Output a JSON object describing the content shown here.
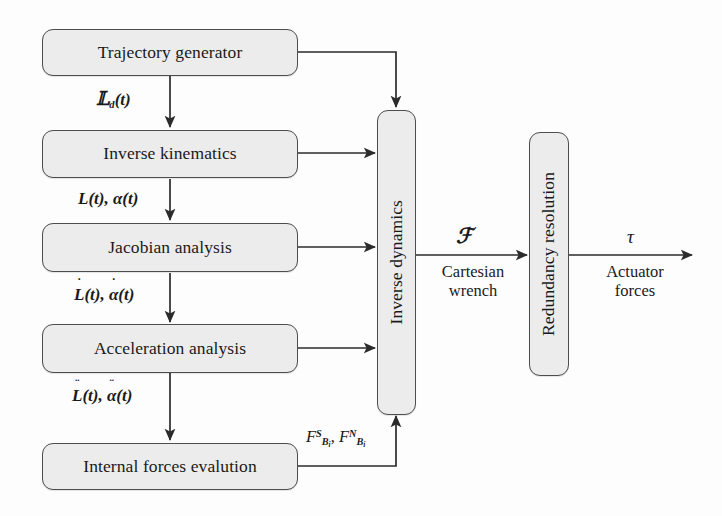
{
  "diagram": {
    "colors": {
      "box_fill": "#ececec",
      "box_border": "#4d4d4d",
      "line": "#2b2b2b",
      "background": "#fdfdfd",
      "text": "#1a1a1a"
    },
    "nodes": [
      {
        "id": "trajectory-generator",
        "label": "Trajectory generator",
        "orientation": "horizontal"
      },
      {
        "id": "inverse-kinematics",
        "label": "Inverse kinematics",
        "orientation": "horizontal"
      },
      {
        "id": "jacobian-analysis",
        "label": "Jacobian analysis",
        "orientation": "horizontal"
      },
      {
        "id": "acceleration-analysis",
        "label": "Acceleration analysis",
        "orientation": "horizontal"
      },
      {
        "id": "internal-forces",
        "label": "Internal forces evalution",
        "orientation": "horizontal"
      },
      {
        "id": "inverse-dynamics",
        "label": "Inverse dynamics",
        "orientation": "vertical"
      },
      {
        "id": "redundancy-resolution",
        "label": "Redundancy resolution",
        "orientation": "vertical"
      }
    ],
    "edge_labels": {
      "xd": {
        "base": "X",
        "sub": "d",
        "arg": "(t)"
      },
      "L_alpha": {
        "first": "L",
        "second": "α",
        "arg": "(t)",
        "sep": ", ",
        "derivative": 0
      },
      "Ldot": {
        "first": "L",
        "second": "α",
        "arg": "(t)",
        "sep": ", ",
        "derivative": 1
      },
      "Lddot": {
        "first": "L",
        "second": "α",
        "arg": "(t)",
        "sep": ", ",
        "derivative": 2
      },
      "forces": {
        "f": "F",
        "sup1": "S",
        "sup2": "N",
        "sub": "B",
        "subsub": "i",
        "sep": ", "
      },
      "wrench_symbol": "ℱ",
      "wrench_caption": "Cartesian\nwrench",
      "torque_symbol": "τ",
      "torque_caption": "Actuator\nforces"
    },
    "captions": {
      "cartesian_wrench_line1": "Cartesian",
      "cartesian_wrench_line2": "wrench",
      "actuator_forces_line1": "Actuator",
      "actuator_forces_line2": "forces"
    }
  }
}
